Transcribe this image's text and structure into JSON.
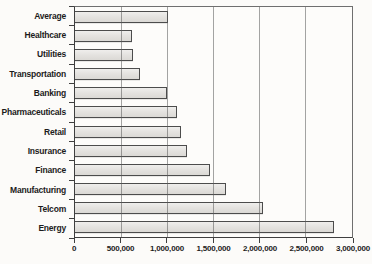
{
  "chart_data": {
    "type": "bar",
    "orientation": "horizontal",
    "title": "",
    "xlabel": "",
    "ylabel": "",
    "categories": [
      "Average",
      "Healthcare",
      "Utilities",
      "Transportation",
      "Banking",
      "Pharmaceuticals",
      "Retail",
      "Insurance",
      "Finance",
      "Manufacturing",
      "Telcom",
      "Energy"
    ],
    "values": [
      1010000,
      620000,
      630000,
      700000,
      1000000,
      1110000,
      1150000,
      1210000,
      1460000,
      1640000,
      2040000,
      2810000
    ],
    "xlim": [
      0,
      3000000
    ],
    "x_tick_interval": 500000,
    "x_tick_labels": [
      "0",
      "500,000",
      "1,000,000",
      "1,500,000",
      "2,000,000",
      "2,500,000",
      "3,000,000"
    ],
    "grid": "vertical-gridlines-on",
    "legend": "none",
    "colors": {
      "bar_fill": "#e4e2df",
      "bar_border": "#4c4c4c",
      "gridline": "#9a9a9a",
      "axis": "#3f3f3f",
      "background": "#fcfbf9",
      "text": "#1c1c1c"
    }
  }
}
